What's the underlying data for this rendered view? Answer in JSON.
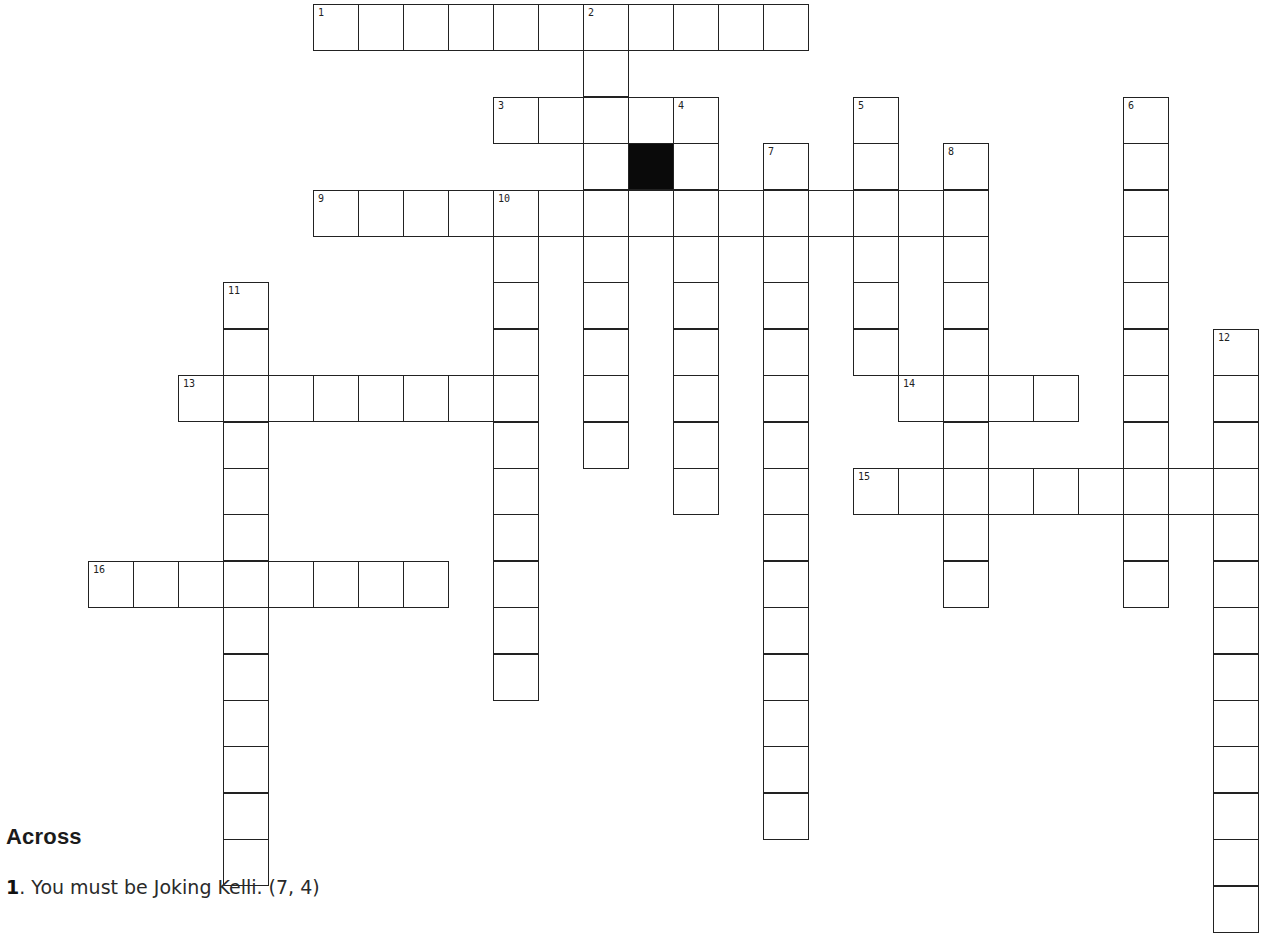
{
  "puzzle": {
    "grid_origin": {
      "x": 88,
      "y": 4
    },
    "cell_size": {
      "w": 45,
      "h": 46.4
    },
    "colors": {
      "border": "#222222",
      "block": "#0a0a0a",
      "background": "#ffffff"
    },
    "words": [
      {
        "number": 1,
        "direction": "across",
        "row": 0,
        "col": 5,
        "length": 11
      },
      {
        "number": 2,
        "direction": "down",
        "row": 0,
        "col": 11,
        "length": 10
      },
      {
        "number": 3,
        "direction": "across",
        "row": 2,
        "col": 9,
        "length": 5
      },
      {
        "number": 4,
        "direction": "down",
        "row": 2,
        "col": 13,
        "length": 9
      },
      {
        "number": 5,
        "direction": "down",
        "row": 2,
        "col": 17,
        "length": 6
      },
      {
        "number": 6,
        "direction": "down",
        "row": 2,
        "col": 23,
        "length": 11
      },
      {
        "number": 7,
        "direction": "down",
        "row": 3,
        "col": 15,
        "length": 15
      },
      {
        "number": 8,
        "direction": "down",
        "row": 3,
        "col": 19,
        "length": 10
      },
      {
        "number": 9,
        "direction": "across",
        "row": 4,
        "col": 5,
        "length": 15
      },
      {
        "number": 10,
        "direction": "down",
        "row": 4,
        "col": 9,
        "length": 11
      },
      {
        "number": 11,
        "direction": "down",
        "row": 6,
        "col": 3,
        "length": 13
      },
      {
        "number": 12,
        "direction": "down",
        "row": 7,
        "col": 25,
        "length": 13
      },
      {
        "number": 13,
        "direction": "across",
        "row": 8,
        "col": 2,
        "length": 8
      },
      {
        "number": 14,
        "direction": "across",
        "row": 8,
        "col": 18,
        "length": 4
      },
      {
        "number": 15,
        "direction": "across",
        "row": 10,
        "col": 17,
        "length": 9
      },
      {
        "number": 16,
        "direction": "across",
        "row": 12,
        "col": 0,
        "length": 8
      }
    ],
    "black_cells": [
      {
        "row": 3,
        "col": 12
      }
    ]
  },
  "clues": {
    "across_heading": "Across",
    "across": [
      {
        "number": "1",
        "text": ".  You must be Joking Kelli. (7, 4)"
      }
    ],
    "partial_next_line": "3. ..."
  }
}
